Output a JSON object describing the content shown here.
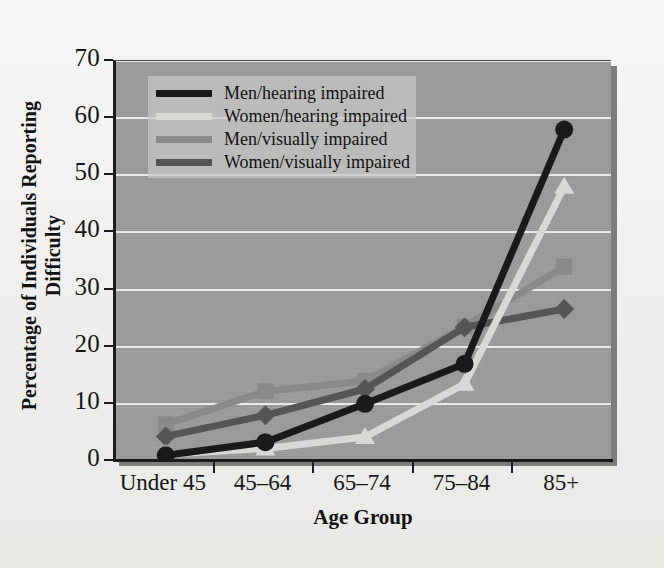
{
  "chart_data": {
    "type": "line",
    "title": "",
    "xlabel": "Age Group",
    "ylabel": "Percentage of Individuals Reporting Difficulty",
    "ylabel_line1": "Percentage of Individuals Reporting",
    "ylabel_line2": "Difficulty",
    "categories": [
      "Under 45",
      "45–64",
      "65–74",
      "75–84",
      "85+"
    ],
    "ylim": [
      0,
      70
    ],
    "yticks": [
      0,
      10,
      20,
      30,
      40,
      50,
      60,
      70
    ],
    "grid": "horizontal",
    "legend_position": "top-left-inside",
    "series": [
      {
        "name": "Men/hearing impaired",
        "color": "#1a1a1a",
        "marker": "circle",
        "values": [
          1.0,
          3.3,
          10.0,
          17.0,
          58.0
        ]
      },
      {
        "name": "Women/hearing impaired",
        "color": "#d8d8d4",
        "marker": "triangle",
        "values": [
          1.2,
          2.2,
          4.2,
          13.5,
          48.0
        ]
      },
      {
        "name": "Men/visually impaired",
        "color": "#8a8a8a",
        "marker": "square",
        "values": [
          6.4,
          12.2,
          14.0,
          23.5,
          34.0
        ]
      },
      {
        "name": "Women/visually impaired",
        "color": "#555555",
        "marker": "diamond",
        "values": [
          4.3,
          8.0,
          12.6,
          23.4,
          26.6
        ]
      }
    ]
  },
  "axes": {
    "ytick_labels": [
      "70",
      "60",
      "50",
      "40",
      "30",
      "20",
      "10",
      "0"
    ],
    "xtick_labels": [
      "Under 45",
      "45–64",
      "65–74",
      "75–84",
      "85+"
    ],
    "y_title_line1": "Percentage of Individuals Reporting",
    "y_title_line2": "Difficulty",
    "x_title": "Age Group"
  },
  "legend": {
    "items": [
      {
        "label": "Men/hearing impaired",
        "color": "#1a1a1a"
      },
      {
        "label": "Women/hearing impaired",
        "color": "#d8d8d4"
      },
      {
        "label": "Men/visually impaired",
        "color": "#8a8a8a"
      },
      {
        "label": "Women/visually impaired",
        "color": "#555555"
      }
    ]
  },
  "colors": {
    "plot_background": "#9b9b9b",
    "figure_background": "#f1f1ef",
    "gridline": "#f0f0ee",
    "axis": "#1b1b1b"
  }
}
